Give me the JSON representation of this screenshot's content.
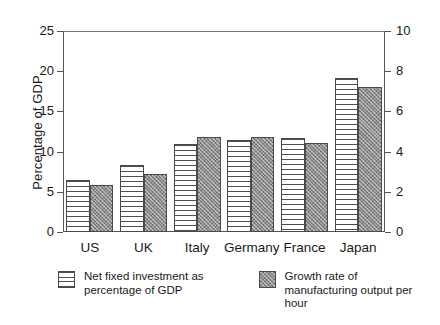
{
  "chart_data": {
    "type": "bar",
    "title": "",
    "xlabel": "",
    "ylabel": "Percentage of GDP",
    "y2label": "",
    "categories": [
      "US",
      "UK",
      "Italy",
      "Germany",
      "France",
      "Japan"
    ],
    "ylim": [
      0,
      25
    ],
    "y2lim": [
      0,
      10
    ],
    "yticks": [
      0,
      5,
      10,
      15,
      20,
      25
    ],
    "y2ticks": [
      0,
      2,
      4,
      6,
      8,
      10
    ],
    "grid": false,
    "legend_position": "below",
    "series": [
      {
        "name": "Net fixed investment as percentage of GDP",
        "axis": "left",
        "fill": "horizontal-stripes",
        "values": [
          6.5,
          8.3,
          11.0,
          11.5,
          11.7,
          19.1
        ]
      },
      {
        "name": "Growth rate of manufacturing output per hour",
        "axis": "right",
        "fill": "gray-stipple",
        "values": [
          2.35,
          2.9,
          4.75,
          4.75,
          4.45,
          7.2
        ]
      }
    ]
  },
  "axes": {
    "left_title": "Percentage of GDP",
    "left_ticklabels": [
      "25",
      "20",
      "15",
      "10",
      "5",
      "0"
    ],
    "right_ticklabels": [
      "10",
      "8",
      "6",
      "4",
      "2",
      "0"
    ]
  },
  "legend": {
    "entries": [
      {
        "label": "Net fixed investment as percentage of GDP",
        "swatch": "horizontal-stripes-swatch"
      },
      {
        "label": "Growth rate of manufacturing output per hour",
        "swatch": "gray-stipple-swatch"
      }
    ]
  }
}
